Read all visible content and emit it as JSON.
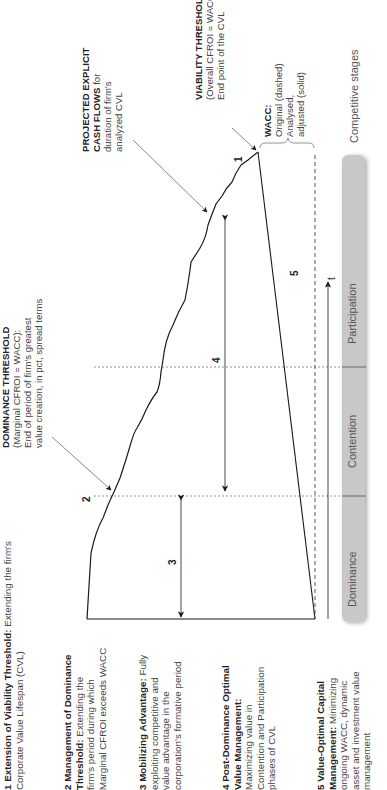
{
  "diagram": {
    "axis": {
      "time_label": "t"
    },
    "markers": [
      "1",
      "2",
      "3",
      "4",
      "5"
    ],
    "stages_header": "Competitive stages",
    "stages": [
      "Dominance",
      "Contention",
      "Participation"
    ],
    "callouts": {
      "projected": {
        "bold": "PROJECTED EXPLICIT",
        "bold2": "CASH FLOWS",
        "rest1": " for",
        "line3": "duration of firm's",
        "line4": "analyzed CVL"
      },
      "viability": {
        "bold": "VIABILITY THRESHOLD",
        "line2": "(Overall CFROI = WACC):",
        "line3": "End point of the CVL"
      },
      "wacc": {
        "bold": "WACC:",
        "line2": "Original (dashed)",
        "line3": "Analysed,",
        "line4": "adjusted (solid)"
      },
      "dominance": {
        "bold": "DOMINANCE THRESHOLD",
        "line2": "(Marginal CFROI = WACC):",
        "line3": "End of period of firm's greatest",
        "line4": "value creation, in pct, spread terms"
      }
    },
    "legend": [
      {
        "bold": "1 Extension of Viability Threshold:",
        "lines": [
          " Extending the firm's",
          "Corporate Value Lifespan (CVL)"
        ]
      },
      {
        "bold": "2 Management of Dominance",
        "bold2": "Threshold:",
        "lines": [
          " Extending the",
          "firm's period during which",
          "Marginal CFROI exceeds WACC"
        ]
      },
      {
        "bold": "3 Mobilizing Advantage:",
        "lines": [
          " Fully",
          "exploiting competitive and",
          "value advantage in the",
          "corporation's formative period"
        ]
      },
      {
        "bold": "4 Post-Dominance Optimal",
        "bold2": "Value Management:",
        "lines": [
          "",
          "Maximizing value in",
          "Contention and Participation",
          "phases of CVL"
        ]
      },
      {
        "bold": "5 Value-Optimal Capital",
        "bold2": "Management:",
        "lines": [
          " Minimizing",
          "ongoing WACC, dynamic",
          "asset and investment value",
          "management"
        ]
      }
    ],
    "colors": {
      "stage_bar": "#c8c8c8",
      "line": "#1a1a1a",
      "dashed": "#555555"
    }
  }
}
